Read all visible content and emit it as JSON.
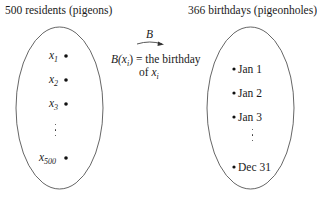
{
  "domain": "Diagram",
  "left_set": {
    "title": "500 residents (pigeons)",
    "items": [
      {
        "var": "x",
        "sub": "1"
      },
      {
        "var": "x",
        "sub": "2"
      },
      {
        "var": "x",
        "sub": "3"
      },
      {
        "var": "x",
        "sub": "500"
      }
    ],
    "ellipsis": "⋮"
  },
  "right_set": {
    "title": "366 birthdays (pigeonholes)",
    "items": [
      "Jan 1",
      "Jan 2",
      "Jan 3",
      "Dec 31"
    ],
    "ellipsis": "⋮"
  },
  "mapping": {
    "arrow_label": "B",
    "definition_line1_prefix": "B(",
    "definition_line1_var": "x",
    "definition_line1_sub": "i",
    "definition_line1_suffix": ") = the birthday",
    "definition_line2_prefix": "of ",
    "definition_line2_var": "x",
    "definition_line2_sub": "i"
  },
  "colors": {
    "stroke": "#555555",
    "text": "#1a1a1a",
    "background": "#ffffff"
  }
}
